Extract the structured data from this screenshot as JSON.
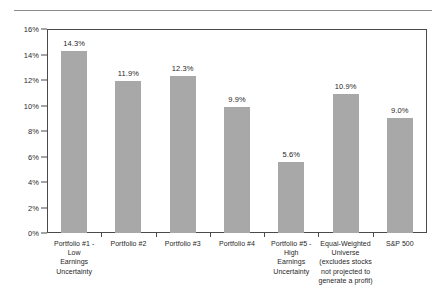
{
  "chart_data": {
    "type": "bar",
    "title": "",
    "xlabel": "",
    "ylabel": "",
    "ylim": [
      0,
      16
    ],
    "grid": false,
    "legend": "none",
    "yticks": [
      "0%",
      "2%",
      "4%",
      "6%",
      "8%",
      "10%",
      "12%",
      "14%",
      "16%"
    ],
    "ytick_values": [
      0,
      2,
      4,
      6,
      8,
      10,
      12,
      14,
      16
    ],
    "categories": [
      "Portfolio #1 - Low Earnings Uncertainty",
      "Portfolio #2",
      "Portfolio #3",
      "Portfolio #4",
      "Portfolio #5 - High Earnings Uncertainty",
      "Equal-Weighted Universe (excludes stocks not projected to generate a profit)",
      "S&P 500"
    ],
    "category_lines": [
      [
        "Portfolio #1 -",
        "Low",
        "Earnings",
        "Uncertainty"
      ],
      [
        "Portfolio #2"
      ],
      [
        "Portfolio #3"
      ],
      [
        "Portfolio #4"
      ],
      [
        "Portfolio #5 -",
        "High",
        "Earnings",
        "Uncertainty"
      ],
      [
        "Equal-Weighted",
        "Universe",
        "(excludes stocks",
        "not projected to",
        "generate a profit)"
      ],
      [
        "S&P 500"
      ]
    ],
    "values": [
      14.3,
      11.9,
      12.3,
      9.9,
      5.6,
      10.9,
      9.0
    ],
    "value_labels": [
      "14.3%",
      "11.9%",
      "12.3%",
      "9.9%",
      "5.6%",
      "10.9%",
      "9.0%"
    ],
    "bar_color": "#a8a8a8",
    "frame_color": "#4a4a4a",
    "text_color": "#1f1f1f",
    "rule_color": "#8c8c8c"
  }
}
